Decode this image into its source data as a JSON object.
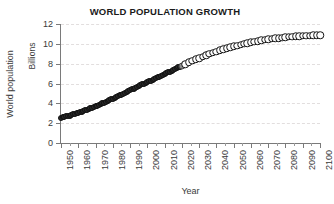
{
  "chart_data": {
    "type": "scatter",
    "title": "WORLD POPULATION GROWTH",
    "xlabel": "Year",
    "ylabel": "World population",
    "ylabel_secondary": "Billions",
    "xlim": [
      1950,
      2100
    ],
    "ylim": [
      0,
      12
    ],
    "ytick_step": 2,
    "xtick_step": 10,
    "grid": true,
    "grid_axis": "y",
    "legend": "none",
    "ytick_labels": [
      "0",
      "2",
      "4",
      "6",
      "8",
      "10",
      "12"
    ],
    "ytick_values": [
      0,
      2,
      4,
      6,
      8,
      10,
      12
    ],
    "xtick_labels": [
      "1950",
      "1960",
      "1970",
      "1980",
      "1990",
      "2000",
      "2010",
      "2020",
      "2030",
      "2040",
      "2050",
      "2060",
      "2070",
      "2080",
      "2090",
      "2100"
    ],
    "xtick_values": [
      1950,
      1960,
      1970,
      1980,
      1990,
      2000,
      2010,
      2020,
      2030,
      2040,
      2050,
      2060,
      2070,
      2080,
      2090,
      2100
    ],
    "series": [
      {
        "name": "Historical",
        "marker": "filled-circle",
        "color": "#2b2b2b",
        "x": [
          1950,
          1951,
          1952,
          1953,
          1954,
          1955,
          1956,
          1957,
          1958,
          1959,
          1960,
          1961,
          1962,
          1963,
          1964,
          1965,
          1966,
          1967,
          1968,
          1969,
          1970,
          1971,
          1972,
          1973,
          1974,
          1975,
          1976,
          1977,
          1978,
          1979,
          1980,
          1981,
          1982,
          1983,
          1984,
          1985,
          1986,
          1987,
          1988,
          1989,
          1990,
          1991,
          1992,
          1993,
          1994,
          1995,
          1996,
          1997,
          1998,
          1999,
          2000,
          2001,
          2002,
          2003,
          2004,
          2005,
          2006,
          2007,
          2008,
          2009,
          2010,
          2011,
          2012,
          2013,
          2014,
          2015,
          2016,
          2017,
          2018,
          2019
        ],
        "values": [
          2.54,
          2.58,
          2.63,
          2.68,
          2.72,
          2.77,
          2.83,
          2.88,
          2.94,
          2.99,
          3.03,
          3.08,
          3.14,
          3.21,
          3.28,
          3.34,
          3.41,
          3.48,
          3.55,
          3.63,
          3.7,
          3.78,
          3.86,
          3.94,
          4.02,
          4.08,
          4.16,
          4.23,
          4.31,
          4.39,
          4.46,
          4.54,
          4.62,
          4.71,
          4.8,
          4.88,
          4.97,
          5.06,
          5.15,
          5.24,
          5.33,
          5.41,
          5.49,
          5.58,
          5.66,
          5.74,
          5.82,
          5.9,
          5.98,
          6.06,
          6.14,
          6.22,
          6.3,
          6.38,
          6.46,
          6.54,
          6.62,
          6.7,
          6.79,
          6.87,
          6.96,
          7.04,
          7.13,
          7.21,
          7.3,
          7.38,
          7.46,
          7.55,
          7.63,
          7.71
        ]
      },
      {
        "name": "Current year",
        "marker": "gray-filled-circle",
        "color": "#8e8e8e",
        "x": [
          2020
        ],
        "values": [
          7.79
        ]
      },
      {
        "name": "Projection",
        "marker": "open-circle",
        "color": "#ffffff",
        "x": [
          2022,
          2024,
          2026,
          2028,
          2030,
          2032,
          2034,
          2036,
          2038,
          2040,
          2042,
          2044,
          2046,
          2048,
          2050,
          2052,
          2054,
          2056,
          2058,
          2060,
          2062,
          2064,
          2066,
          2068,
          2070,
          2072,
          2074,
          2076,
          2078,
          2080,
          2082,
          2084,
          2086,
          2088,
          2090,
          2092,
          2094,
          2096,
          2098,
          2100
        ],
        "values": [
          7.95,
          8.12,
          8.28,
          8.44,
          8.55,
          8.7,
          8.85,
          8.99,
          9.12,
          9.2,
          9.33,
          9.45,
          9.56,
          9.66,
          9.74,
          9.83,
          9.92,
          10.0,
          10.08,
          10.15,
          10.22,
          10.28,
          10.34,
          10.4,
          10.45,
          10.5,
          10.54,
          10.58,
          10.62,
          10.66,
          10.69,
          10.72,
          10.75,
          10.77,
          10.79,
          10.81,
          10.83,
          10.85,
          10.86,
          10.87
        ]
      }
    ]
  }
}
